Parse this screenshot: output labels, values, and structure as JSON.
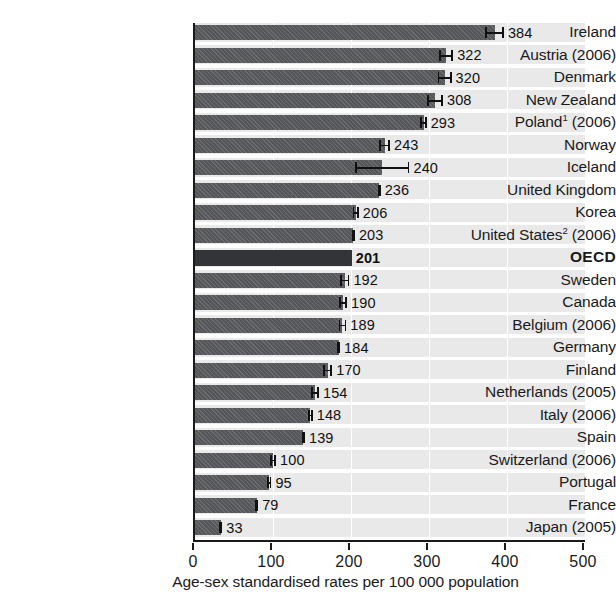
{
  "chart_data": {
    "type": "bar",
    "orientation": "horizontal",
    "title": "",
    "xlabel": "Age-sex standardised rates per 100 000 population",
    "ylabel": "",
    "xlim": [
      0,
      500
    ],
    "xticks": [
      0,
      100,
      200,
      300,
      400,
      500
    ],
    "xtick_labels": [
      "0",
      "100",
      "200",
      "300",
      "400",
      "500"
    ],
    "grid": "vertical-light",
    "legend": "none",
    "categories": [
      "Ireland",
      "Austria (2006)",
      "Denmark",
      "New Zealand",
      "Poland¹ (2006)",
      "Norway",
      "Iceland",
      "United Kingdom",
      "Korea",
      "United States² (2006)",
      "OECD",
      "Sweden",
      "Canada",
      "Belgium (2006)",
      "Germany",
      "Finland",
      "Netherlands (2005)",
      "Italy (2006)",
      "Spain",
      "Switzerland (2006)",
      "Portugal",
      "France",
      "Japan (2005)"
    ],
    "values": [
      384,
      322,
      320,
      308,
      293,
      243,
      240,
      236,
      206,
      203,
      201,
      192,
      190,
      189,
      184,
      170,
      154,
      148,
      139,
      100,
      95,
      79,
      33
    ],
    "value_labels": [
      "384",
      "322",
      "320",
      "308",
      "293",
      "243",
      "240",
      "236",
      "206",
      "203",
      "201",
      "192",
      "190",
      "189",
      "184",
      "170",
      "154",
      "148",
      "139",
      "100",
      "95",
      "79",
      "33"
    ],
    "error_low": [
      372,
      313,
      311,
      298,
      289,
      236,
      205,
      234,
      202,
      201,
      201,
      186,
      185,
      184,
      182,
      164,
      149,
      145,
      137,
      96,
      92,
      77,
      31
    ],
    "error_high": [
      396,
      331,
      329,
      318,
      297,
      250,
      275,
      238,
      210,
      205,
      201,
      198,
      195,
      194,
      186,
      176,
      159,
      151,
      141,
      104,
      98,
      81,
      35
    ],
    "highlight_index": 10,
    "highlight_label": "OECD",
    "bar_color": "#555659",
    "highlight_color": "#333437",
    "plot_background": "#ebebeb",
    "axis_color": "#1a1a1a",
    "error_bar_color": "#111111"
  }
}
